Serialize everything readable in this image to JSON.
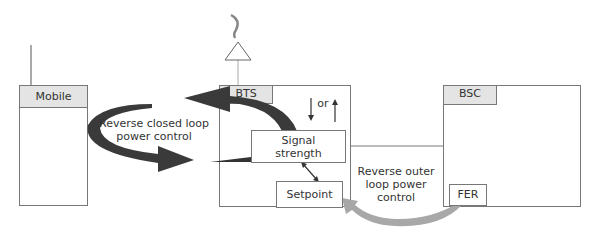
{
  "diagram": {
    "nodes": {
      "mobile": {
        "label": "Mobile"
      },
      "bts": {
        "label": "BTS"
      },
      "bsc": {
        "label": "BSC"
      },
      "signal_strength": {
        "label_line1": "Signal",
        "label_line2": "strength"
      },
      "setpoint": {
        "label": "Setpoint"
      },
      "fer": {
        "label": "FER"
      }
    },
    "annotations": {
      "closed_loop_line1": "Reverse closed loop",
      "closed_loop_line2": "power control",
      "outer_loop_line1": "Reverse outer",
      "outer_loop_line2": "loop power",
      "outer_loop_line3": "control",
      "or_label": "or"
    },
    "colors": {
      "closed_loop_arrow": "#3a3a3a",
      "outer_loop_arrow": "#a8a8a8",
      "box_border": "#777777",
      "header_fill": "#e4e4e4"
    }
  }
}
